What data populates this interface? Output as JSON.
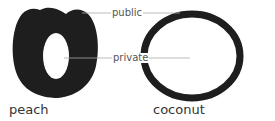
{
  "figures": [
    {
      "id": "peach",
      "caption": "peach"
    },
    {
      "id": "coconut",
      "caption": "coconut"
    }
  ],
  "labels": {
    "public": "public",
    "private": "private"
  },
  "colors": {
    "shape_fill": "#1e1e1e",
    "leader_line": "#aaaaaa",
    "label_text": "#555555"
  }
}
